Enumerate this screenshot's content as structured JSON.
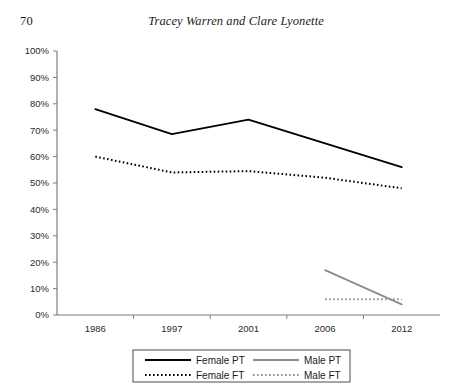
{
  "page": {
    "folio": "70",
    "running_head": "Tracey Warren and Clare Lyonette"
  },
  "chart_data": {
    "type": "line",
    "title": "",
    "xlabel": "",
    "ylabel": "",
    "categories": [
      "1986",
      "1997",
      "2001",
      "2006",
      "2012"
    ],
    "ylim": [
      0,
      100
    ],
    "y_ticks": [
      "0%",
      "10%",
      "20%",
      "30%",
      "40%",
      "50%",
      "60%",
      "70%",
      "80%",
      "90%",
      "100%"
    ],
    "y_tick_values": [
      0,
      10,
      20,
      30,
      40,
      50,
      60,
      70,
      80,
      90,
      100
    ],
    "grid": false,
    "legend_position": "bottom",
    "series": [
      {
        "name": "Female PT",
        "style": "solid",
        "color": "#000000",
        "x": [
          "1986",
          "1997",
          "2001",
          "2006",
          "2012"
        ],
        "values": [
          78,
          68.5,
          74,
          65,
          56
        ]
      },
      {
        "name": "Female FT",
        "style": "dotted",
        "color": "#000000",
        "x": [
          "1986",
          "1997",
          "2001",
          "2006",
          "2012"
        ],
        "values": [
          60,
          54,
          54.5,
          52,
          48
        ]
      },
      {
        "name": "Male PT",
        "style": "solid",
        "color": "#8c8c8c",
        "x": [
          "2006",
          "2012"
        ],
        "values": [
          17,
          4
        ]
      },
      {
        "name": "Male FT",
        "style": "dotted",
        "color": "#8c8c8c",
        "x": [
          "2006",
          "2012"
        ],
        "values": [
          6,
          6
        ]
      }
    ]
  },
  "legend": {
    "entries": [
      {
        "label": "Female PT",
        "style": "solid",
        "color": "#000000"
      },
      {
        "label": "Male PT",
        "style": "solid",
        "color": "#8c8c8c"
      },
      {
        "label": "Female FT",
        "style": "dotted",
        "color": "#000000"
      },
      {
        "label": "Male FT",
        "style": "dotted",
        "color": "#8c8c8c"
      }
    ]
  },
  "colors": {
    "axis": "#7d7d7d",
    "female": "#000000",
    "male": "#8c8c8c",
    "text": "#1a1a1a"
  }
}
